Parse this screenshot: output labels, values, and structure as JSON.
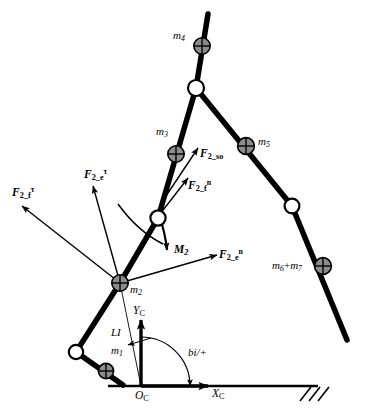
{
  "figure": {
    "type": "mechanism-free-body-diagram"
  },
  "masses": [
    {
      "id": "m1",
      "base": "m",
      "subscript": "1",
      "label": "m1"
    },
    {
      "id": "m2",
      "base": "m",
      "subscript": "2",
      "label": "m2"
    },
    {
      "id": "m3",
      "base": "m",
      "subscript": "3",
      "label": "m3"
    },
    {
      "id": "m4",
      "base": "m",
      "subscript": "4",
      "label": "m4"
    },
    {
      "id": "m5",
      "base": "m",
      "subscript": "5",
      "label": "m5"
    },
    {
      "id": "m6m7",
      "base": "m",
      "subscript": "6",
      "label": "m6+m7",
      "second_base": "m",
      "second_subscript": "7",
      "operator": "+"
    }
  ],
  "forces": [
    {
      "id": "F2_f_tau",
      "base": "F",
      "subscript": "2_f",
      "superscript": "τ",
      "label": "F2_f tau"
    },
    {
      "id": "F2_e_tau",
      "base": "F",
      "subscript": "2_e",
      "superscript": "τ",
      "label": "F2_e tau"
    },
    {
      "id": "F2_so",
      "base": "F",
      "subscript": "2_so",
      "superscript": "",
      "label": "F2_so"
    },
    {
      "id": "F2_f_n",
      "base": "F",
      "subscript": "2_f",
      "superscript": "n",
      "label": "F2_f n"
    },
    {
      "id": "F2_e_n",
      "base": "F",
      "subscript": "2_e",
      "superscript": "n",
      "label": "F2_e n"
    }
  ],
  "moments": [
    {
      "id": "M2",
      "base": "M",
      "subscript": "2",
      "label": "M2"
    }
  ],
  "coordinate_frame": {
    "origin": {
      "base": "O",
      "subscript": "C",
      "label": "OC"
    },
    "x_axis": {
      "base": "X",
      "subscript": "C",
      "label": "XC"
    },
    "y_axis": {
      "base": "Y",
      "subscript": "C",
      "label": "YC"
    }
  },
  "parameters": [
    {
      "id": "LI",
      "label": "LI"
    },
    {
      "id": "angle",
      "label": "bi/+"
    }
  ],
  "colors": {
    "link": "#000000",
    "mass_fill": "#8c8c8c",
    "joint_fill": "#ffffff",
    "stroke": "#000000",
    "background": "#ffffff"
  }
}
